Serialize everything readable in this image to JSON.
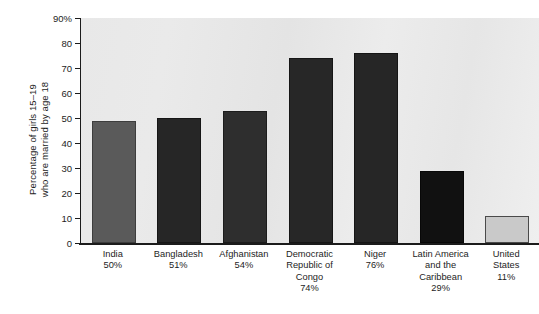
{
  "chart_data": {
    "type": "bar",
    "title": "",
    "xlabel": "",
    "ylabel": "Percentage of girls 15–19 who are married by age 18",
    "ylabel_lines": [
      "Percentage of girls 15–19",
      "who are married by age 18"
    ],
    "ylim": [
      0,
      90
    ],
    "ytick_values": [
      0,
      10,
      20,
      30,
      40,
      50,
      60,
      70,
      80,
      90
    ],
    "ytick_labels": [
      "0",
      "10",
      "20",
      "30",
      "40",
      "50",
      "60",
      "70",
      "80",
      "90%"
    ],
    "grid": false,
    "legend": null,
    "categories": [
      "India",
      "Bangladesh",
      "Afghanistan",
      "Democratic Republic of Congo",
      "Niger",
      "Latin America and the Caribbean",
      "United States"
    ],
    "category_label_lines": [
      [
        "India"
      ],
      [
        "Bangladesh"
      ],
      [
        "Afghanistan"
      ],
      [
        "Democratic",
        "Republic of",
        "Congo"
      ],
      [
        "Niger"
      ],
      [
        "Latin America",
        "and the",
        "Caribbean"
      ],
      [
        "United",
        "States"
      ]
    ],
    "value_labels": [
      "50%",
      "51%",
      "54%",
      "74%",
      "76%",
      "29%",
      "11%"
    ],
    "values": [
      49,
      50,
      53,
      74,
      76,
      29,
      11
    ],
    "bar_colors": [
      "#5a5a5a",
      "#262626",
      "#2e2e2e",
      "#272727",
      "#262626",
      "#111111",
      "#c9c9c9"
    ],
    "bar_border_colors": [
      "#3d3d3d",
      "#161616",
      "#1c1c1c",
      "#161616",
      "#151515",
      "#080808",
      "#4a4a4a"
    ],
    "plot_background": "#e8e8e8",
    "axis_color": "#1b1b1b"
  }
}
